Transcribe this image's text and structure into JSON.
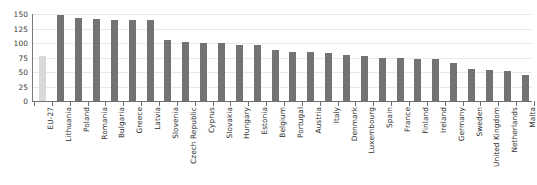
{
  "chart_data": {
    "type": "bar",
    "title": "",
    "subtitle": "",
    "xlabel": "",
    "ylabel": "",
    "ylim": [
      0,
      150
    ],
    "yticks": [
      0,
      25,
      50,
      75,
      100,
      125,
      150
    ],
    "grid": true,
    "legend": "none",
    "orientation": "vertical",
    "categories": [
      "EU-27",
      "Lithuania",
      "Poland",
      "Romania",
      "Bulgaria",
      "Greece",
      "Latvia",
      "Slovenia",
      "Czech Republic",
      "Cyprus",
      "Slovakia",
      "Hungary",
      "Estonia",
      "Belgium",
      "Portugal",
      "Austria",
      "Italy",
      "Denmark",
      "Luxembourg",
      "Spain",
      "France",
      "Finland",
      "Ireland",
      "Germany",
      "Sweden",
      "United Kingdom",
      "Netherlands",
      "Malta"
    ],
    "values": [
      77,
      148,
      143,
      142,
      139,
      139,
      139,
      106,
      101,
      100,
      100,
      97,
      96,
      88,
      85,
      84,
      83,
      80,
      78,
      75,
      74,
      72,
      72,
      66,
      55,
      53,
      52,
      44
    ],
    "highlight_category": "EU-27",
    "colors": {
      "bar": "#737373",
      "highlight_bar": "#d9d9d9",
      "gridline": "#e8e8e8",
      "axis": "#6e6e6e",
      "tick_label": "#2f2f2f",
      "background": "#ffffff"
    }
  }
}
